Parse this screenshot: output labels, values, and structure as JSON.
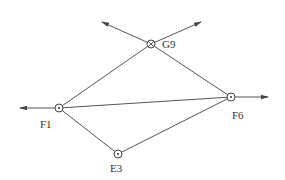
{
  "diagram": {
    "type": "network",
    "nodes": [
      {
        "id": "G9",
        "label": "G9",
        "x": 151,
        "y": 44,
        "symbol": "circle-cross",
        "label_x": 162,
        "label_y": 48
      },
      {
        "id": "F1",
        "label": "F1",
        "x": 59,
        "y": 108,
        "symbol": "circle-dot",
        "label_x": 40,
        "label_y": 128
      },
      {
        "id": "F6",
        "label": "F6",
        "x": 231,
        "y": 97,
        "symbol": "circle-dot",
        "label_x": 232,
        "label_y": 119
      },
      {
        "id": "E3",
        "label": "E3",
        "x": 118,
        "y": 154,
        "symbol": "circle-dot",
        "label_x": 110,
        "label_y": 172
      }
    ],
    "edges": [
      {
        "from": "F1",
        "to": "G9"
      },
      {
        "from": "G9",
        "to": "F6"
      },
      {
        "from": "F1",
        "to": "F6"
      },
      {
        "from": "F1",
        "to": "E3"
      },
      {
        "from": "E3",
        "to": "F6"
      }
    ],
    "rays": [
      {
        "from": "G9",
        "x2": 102,
        "y2": 22,
        "direction": "up-left"
      },
      {
        "from": "G9",
        "x2": 201,
        "y2": 22,
        "direction": "up-right"
      },
      {
        "from": "F1",
        "x2": 20,
        "y2": 108,
        "direction": "left"
      },
      {
        "from": "F6",
        "x2": 268,
        "y2": 97,
        "direction": "right"
      }
    ],
    "colors": {
      "line": "#555555",
      "node": "#444444",
      "label": "#333333",
      "background": "#ffffff"
    }
  }
}
